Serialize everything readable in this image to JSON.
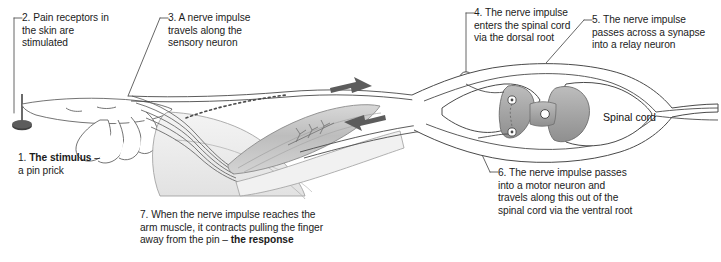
{
  "diagram": {
    "colors": {
      "background": "#ffffff",
      "ink": "#1b1b1b",
      "outline": "#4a4a4a",
      "grey_matter": "#a8a8a8",
      "grey_matter_dark": "#8c8c8c",
      "muscle": "#b9b9b9",
      "arm_light": "#ededed",
      "arrow": "#5a5a5a",
      "pin": "#3a3a3a"
    },
    "labels": [
      {
        "id": "label-1",
        "number": "1.",
        "bold": "The stimulus",
        "text_before_bold": "1. ",
        "text": "1. The stimulus –\na pin prick",
        "line1_bold": "The stimulus",
        "line1_suffix": " –",
        "line2": "a pin prick"
      },
      {
        "id": "label-2",
        "text": "2. Pain receptors in\nthe skin are\nstimulated"
      },
      {
        "id": "label-3",
        "text": "3. A nerve impulse\ntravels along the\nsensory neuron"
      },
      {
        "id": "label-4",
        "text": "4. The nerve impulse\nenters the spinal cord\nvia the dorsal root"
      },
      {
        "id": "label-5",
        "text": "5. The nerve impulse\npasses across a synapse\ninto a relay neuron"
      },
      {
        "id": "label-6",
        "text": "6. The nerve impulse passes\ninto a motor neuron and\ntravels along this out of the\nspinal cord via the ventral root"
      },
      {
        "id": "label-7",
        "line1": "7. When the nerve impulse reaches the",
        "line2": "arm muscle, it contracts pulling the finger",
        "line3_prefix": "away from the pin – ",
        "line3_bold": "the response"
      }
    ],
    "structure_label": {
      "id": "spinal-cord-label",
      "text": "Spinal cord"
    },
    "arrows": [
      {
        "id": "impulse-arrow-right",
        "direction": "right",
        "meaning": "sensory impulse toward spinal cord"
      },
      {
        "id": "impulse-arrow-left",
        "direction": "left",
        "meaning": "motor impulse toward arm muscle"
      }
    ]
  }
}
